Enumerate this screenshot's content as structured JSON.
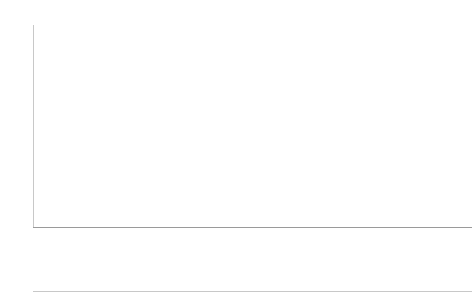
{
  "chart_data": {
    "type": "bar",
    "stacked": true,
    "title": "",
    "subtitle": "",
    "xlabel": "",
    "ylabel": "",
    "ylim": [
      0,
      60
    ],
    "yticks": [
      0,
      10,
      20,
      30,
      40,
      50,
      60
    ],
    "grid": true,
    "legend_position": "top-left",
    "categories": [
      "1960",
      "1970",
      "1978"
    ],
    "groups": [
      "Austria",
      "Czechia",
      "Netherlands",
      "Russia",
      "Spain",
      "Sweden"
    ],
    "series": [
      {
        "name": "childless",
        "color": "#c2c2c2",
        "values_by_group": {
          "Austria": [
            17.5,
            20.5,
            22.0
          ],
          "Czechia": [
            7.0,
            9.0,
            15.0
          ],
          "Netherlands": [
            18.5,
            19.5,
            19.0
          ],
          "Russia": [
            6.0,
            9.0,
            14.0
          ],
          "Spain": [
            12.0,
            22.0,
            29.0
          ],
          "Sweden": [
            15.5,
            16.0,
            18.5
          ]
        }
      },
      {
        "name": "one child",
        "color": "#3b3b3b",
        "values_by_group": {
          "Austria": [
            23.5,
            23.5,
            22.5
          ],
          "Czechia": [
            15.0,
            21.0,
            23.0
          ],
          "Netherlands": [
            15.5,
            18.5,
            18.0
          ],
          "Russia": [
            28.5,
            42.5,
            32.5
          ],
          "Spain": [
            27.0,
            29.0,
            28.0
          ],
          "Sweden": [
            13.5,
            13.0,
            13.0
          ]
        }
      }
    ],
    "totals_by_group": {
      "Austria": [
        41.0,
        44.0,
        44.5
      ],
      "Czechia": [
        22.0,
        30.0,
        38.0
      ],
      "Netherlands": [
        34.0,
        38.0,
        37.0
      ],
      "Russia": [
        34.5,
        51.5,
        46.5
      ],
      "Spain": [
        39.0,
        51.0,
        57.0
      ],
      "Sweden": [
        29.0,
        29.0,
        31.5
      ]
    }
  },
  "legend": {
    "items": [
      {
        "label": "childless",
        "color": "#c2c2c2"
      },
      {
        "label": "one child",
        "color": "#3b3b3b"
      }
    ]
  },
  "axis": {
    "y_ticks": [
      "0",
      "10",
      "20",
      "30",
      "40",
      "50",
      "60"
    ]
  },
  "colors": {
    "childless": "#c2c2c2",
    "one_child": "#3b3b3b",
    "gridline": "#dcdcdc",
    "axis": "#c8c8c8",
    "text": "#1a1a1a",
    "background": "#ffffff"
  }
}
